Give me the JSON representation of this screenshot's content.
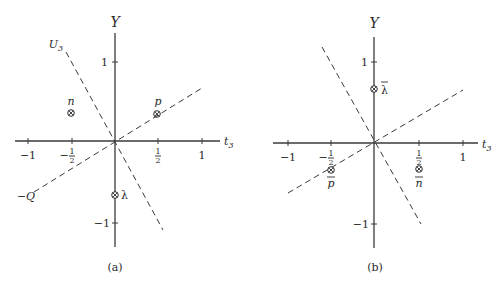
{
  "figure": {
    "panels": [
      {
        "id": "a",
        "caption": "(a)",
        "y_axis_label": "Y",
        "x_axis_label": "t",
        "x_axis_label_sub": "3",
        "ticks": {
          "x_neg1": "−1",
          "x_neg_half_sign": "−",
          "x_half_num": "1",
          "x_half_den": "2",
          "x_pos1": "1",
          "y_pos1": "1",
          "y_neg1": "−1"
        },
        "lines": {
          "u3_label": "U",
          "u3_sub": "3",
          "q_label": "−Q"
        },
        "points": [
          {
            "name": "n",
            "label": "n",
            "t3": -0.5,
            "Y": 1
          },
          {
            "name": "p",
            "label": "p",
            "t3": 0.5,
            "Y": 1
          },
          {
            "name": "lambda",
            "label": "λ",
            "t3": 0,
            "Y": -1
          }
        ]
      },
      {
        "id": "b",
        "caption": "(b)",
        "y_axis_label": "Y",
        "x_axis_label": "t",
        "x_axis_label_sub": "3",
        "ticks": {
          "x_neg1": "−1",
          "x_neg_half_sign": "−",
          "x_half_num": "1",
          "x_half_den": "2",
          "x_pos1": "1",
          "y_pos1": "1",
          "y_neg1": "−1"
        },
        "points": [
          {
            "name": "anti-lambda",
            "label": "λ",
            "overbar": true,
            "t3": 0,
            "Y": 1
          },
          {
            "name": "anti-p",
            "label": "p",
            "overbar": true,
            "t3": -0.5,
            "Y": -1
          },
          {
            "name": "anti-n",
            "label": "n",
            "overbar": true,
            "t3": 0.5,
            "Y": -1
          }
        ]
      }
    ]
  }
}
